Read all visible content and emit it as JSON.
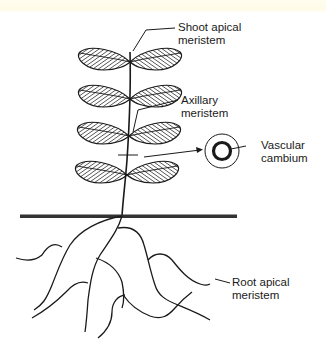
{
  "diagram": {
    "type": "plant-meristem-diagram",
    "colors": {
      "line": "#1a1a1a",
      "ground": "#333333",
      "background": "#ffffff",
      "top_tint": "#fefbe6"
    },
    "labels": {
      "shoot_apical": {
        "line1": "Shoot apical",
        "line2": "meristem"
      },
      "axillary": {
        "line1": "Axillary",
        "line2": "meristem"
      },
      "vascular": {
        "line1": "Vascular",
        "line2": "cambium"
      },
      "root_apical": {
        "line1": "Root apical",
        "line2": "meristem"
      }
    },
    "components": [
      "shoot with 4 pairs of hatched leaves",
      "stem",
      "ground line",
      "branched root system",
      "stem cross-section showing vascular cambium ring"
    ],
    "leaf_pairs": 4
  }
}
